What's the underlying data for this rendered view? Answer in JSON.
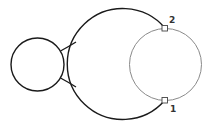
{
  "diagram": {
    "colors": {
      "background": "#ffffff",
      "outline": "#1a1a1a",
      "construction_circle": "#8a8a8a",
      "label": "#333333"
    },
    "shapes": {
      "small_circle": {
        "cx": 37.5,
        "cy": 64.5,
        "r": 26.5
      },
      "large_arc": {
        "cx": 128,
        "cy": 64.5,
        "r": 55.5
      },
      "construction_circle": {
        "cx": 165.5,
        "cy": 64.5,
        "r": 36
      }
    },
    "markers": [
      {
        "id": "1",
        "label": "1",
        "x": 165,
        "y": 100
      },
      {
        "id": "2",
        "label": "2",
        "x": 165,
        "y": 28
      }
    ]
  }
}
